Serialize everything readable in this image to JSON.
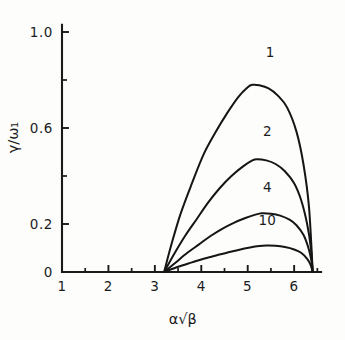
{
  "chart_data": {
    "type": "line",
    "title": "",
    "xlabel": "α√β",
    "ylabel": "γ/ω₁",
    "xlim": [
      1,
      6.6
    ],
    "ylim": [
      0,
      1.05
    ],
    "grid": false,
    "legend_position": "inline-curve-labels",
    "x_ticks_major": [
      "1",
      "2",
      "3",
      "4",
      "5",
      "6"
    ],
    "x_ticks_major_values": [
      1,
      2,
      3,
      4,
      5,
      6
    ],
    "x_ticks_minor_values": [
      1.5,
      2.5,
      3.5,
      4.5,
      5.5,
      6.5
    ],
    "y_ticks_major": [
      "0",
      "0.2",
      "0.6",
      "1.0"
    ],
    "y_ticks_major_values": [
      0,
      0.2,
      0.6,
      1.0
    ],
    "y_ticks_minor_values": [
      0.4,
      0.8
    ],
    "series": [
      {
        "name": "1",
        "label": "1",
        "peak_x": 5.1,
        "peak_y": 0.78,
        "x_start": 3.2,
        "x_end": 6.4,
        "x": [
          3.2,
          3.35,
          3.55,
          3.8,
          4.05,
          4.3,
          4.55,
          4.8,
          5.0,
          5.1,
          5.25,
          5.45,
          5.65,
          5.85,
          6.05,
          6.2,
          6.32,
          6.4
        ],
        "values": [
          0.0,
          0.11,
          0.24,
          0.37,
          0.49,
          0.58,
          0.66,
          0.73,
          0.77,
          0.78,
          0.778,
          0.765,
          0.735,
          0.685,
          0.585,
          0.45,
          0.27,
          0.0
        ]
      },
      {
        "name": "2",
        "label": "2",
        "peak_x": 5.2,
        "peak_y": 0.47,
        "x_start": 3.2,
        "x_end": 6.4,
        "x": [
          3.2,
          3.4,
          3.65,
          3.9,
          4.15,
          4.4,
          4.65,
          4.9,
          5.1,
          5.2,
          5.4,
          5.6,
          5.8,
          6.0,
          6.15,
          6.28,
          6.36,
          6.4
        ],
        "values": [
          0.0,
          0.07,
          0.15,
          0.22,
          0.29,
          0.35,
          0.4,
          0.44,
          0.465,
          0.47,
          0.465,
          0.45,
          0.42,
          0.37,
          0.3,
          0.2,
          0.1,
          0.0
        ]
      },
      {
        "name": "4",
        "label": "4",
        "peak_x": 5.3,
        "peak_y": 0.245,
        "x_start": 3.2,
        "x_end": 6.4,
        "x": [
          3.2,
          3.45,
          3.7,
          3.95,
          4.2,
          4.45,
          4.7,
          4.95,
          5.15,
          5.3,
          5.5,
          5.7,
          5.9,
          6.05,
          6.2,
          6.3,
          6.37,
          6.4
        ],
        "values": [
          0.0,
          0.04,
          0.08,
          0.115,
          0.15,
          0.18,
          0.205,
          0.225,
          0.238,
          0.245,
          0.243,
          0.235,
          0.218,
          0.195,
          0.155,
          0.105,
          0.05,
          0.0
        ]
      },
      {
        "name": "10",
        "label": "10",
        "peak_x": 5.4,
        "peak_y": 0.11,
        "x_start": 3.2,
        "x_end": 6.4,
        "x": [
          3.2,
          3.5,
          3.8,
          4.05,
          4.3,
          4.55,
          4.8,
          5.05,
          5.25,
          5.4,
          5.6,
          5.8,
          6.0,
          6.15,
          6.28,
          6.35,
          6.4
        ],
        "values": [
          0.0,
          0.022,
          0.04,
          0.055,
          0.068,
          0.08,
          0.092,
          0.102,
          0.108,
          0.11,
          0.109,
          0.104,
          0.094,
          0.08,
          0.055,
          0.032,
          0.0
        ]
      }
    ],
    "curve_label_positions": [
      {
        "label": "1",
        "x": 5.48,
        "y": 0.895
      },
      {
        "label": "2",
        "x": 5.42,
        "y": 0.565
      },
      {
        "label": "4",
        "x": 5.42,
        "y": 0.335
      },
      {
        "label": "10",
        "x": 5.42,
        "y": 0.195
      }
    ]
  }
}
